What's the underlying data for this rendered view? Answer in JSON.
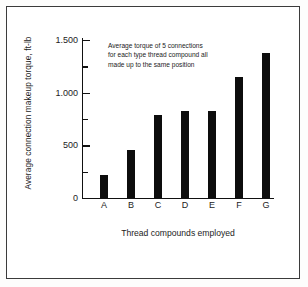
{
  "chart_data": {
    "type": "bar",
    "title": "",
    "categories": [
      "A",
      "B",
      "C",
      "D",
      "E",
      "F",
      "G"
    ],
    "values": [
      220,
      460,
      790,
      825,
      828,
      1150,
      1380
    ],
    "series": [
      {
        "name": "Average connection makeup torque",
        "values": [
          220,
          460,
          790,
          825,
          828,
          1150,
          1380
        ]
      }
    ],
    "xlabel": "Thread compounds employed",
    "ylabel": "Average connection makeup torque, ft-lb",
    "ylim": [
      0,
      1500
    ],
    "ytick_values": [
      0,
      250,
      500,
      750,
      1000,
      1250,
      1500
    ],
    "ytick_major_values": [
      0,
      500,
      1000,
      1500
    ],
    "ytick_major_labels": [
      "0",
      "500",
      "1.000",
      "1.500"
    ],
    "grid": false,
    "legend": false,
    "annotations": [
      "Average torque of 5 connections",
      "for each type thread compound all",
      "made up to the same position"
    ],
    "bar_color": "#0d0d0d",
    "axis_color": "#111111",
    "background_color": "#ffffff",
    "border_color": "#3b3b3b"
  }
}
